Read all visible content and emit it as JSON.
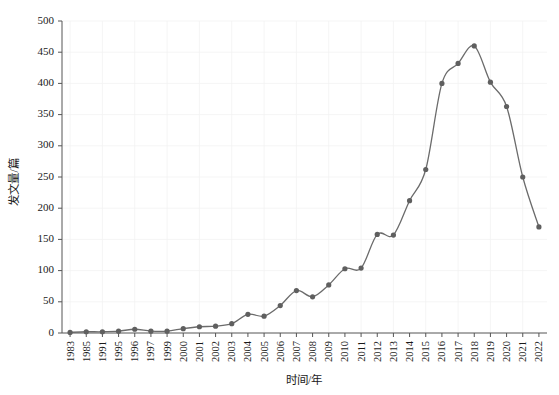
{
  "chart_data": {
    "type": "line",
    "title": "",
    "xlabel": "时间/年",
    "ylabel": "发文量/篇",
    "xlim": [
      0,
      29
    ],
    "ylim": [
      0,
      500
    ],
    "ytick_values": [
      0,
      50,
      100,
      150,
      200,
      250,
      300,
      350,
      400,
      450,
      500
    ],
    "ytick_labels": [
      "0",
      "50",
      "100",
      "150",
      "200",
      "250",
      "300",
      "350",
      "400",
      "450",
      "500"
    ],
    "grid": true,
    "legend": "none",
    "line_color": "#6b6b6b",
    "marker_color": "#5f5f5f",
    "marker_shape": "circle",
    "categories": [
      "1983",
      "1985",
      "1991",
      "1995",
      "1996",
      "1997",
      "1999",
      "2000",
      "2001",
      "2002",
      "2003",
      "2004",
      "2005",
      "2006",
      "2007",
      "2008",
      "2009",
      "2010",
      "2011",
      "2012",
      "2013",
      "2014",
      "2015",
      "2016",
      "2017",
      "2018",
      "2019",
      "2020",
      "2021",
      "2022"
    ],
    "values": [
      1,
      2,
      2,
      3,
      6,
      3,
      3,
      7,
      10,
      11,
      15,
      30,
      27,
      44,
      68,
      58,
      77,
      103,
      104,
      158,
      157,
      212,
      262,
      400,
      432,
      460,
      402,
      363,
      250,
      170
    ],
    "series": [
      {
        "name": "发文量",
        "values": [
          1,
          2,
          2,
          3,
          6,
          3,
          3,
          7,
          10,
          11,
          15,
          30,
          27,
          44,
          68,
          58,
          77,
          103,
          104,
          158,
          157,
          212,
          262,
          400,
          432,
          460,
          402,
          363,
          250,
          170
        ]
      }
    ],
    "annotations": []
  },
  "layout": {
    "plot_left": 62,
    "plot_right": 547,
    "plot_top": 21,
    "plot_bottom": 333
  }
}
